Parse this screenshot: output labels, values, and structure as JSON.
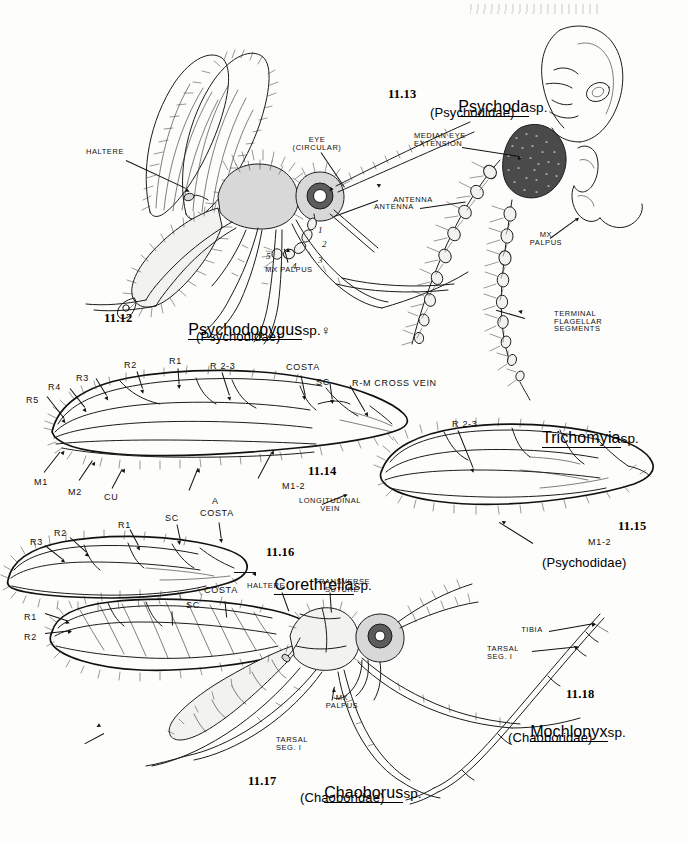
{
  "plate": {
    "title": "Plate 11 — Psychodidae and Chaoboridae",
    "background_color": "#fdfdfb",
    "ink_color": "#1b1b1b"
  },
  "figures": [
    {
      "number": "11.12",
      "genus": "Psychodopygus",
      "sp": "sp.",
      "sex_symbol": "♀",
      "family": "(Psychodidae)",
      "subject": "adult-sand-fly-lateral"
    },
    {
      "number": "11.13",
      "genus": "Psychoda",
      "sp": "sp.",
      "family": "(Psychodidae)",
      "subject": "head-antenna-detail"
    },
    {
      "number": "11.14",
      "genus": "",
      "sp": "",
      "family": "",
      "subject": "psychodid-wing-venation"
    },
    {
      "number": "11.15",
      "genus": "Trichomyia",
      "sp": "sp.",
      "family": "(Psychodidae)",
      "subject": "trichomyia-wing"
    },
    {
      "number": "11.16",
      "genus": "Corethrella",
      "sp": "sp.",
      "family": "",
      "subject": "corethrella-wing"
    },
    {
      "number": "11.17",
      "genus": "Chaoborus",
      "sp": "sp.",
      "family": "(Chaoboridae)",
      "subject": "adult-phantom-midge-lateral"
    },
    {
      "number": "11.18",
      "genus": "Mochlonyx",
      "sp": "sp.",
      "family": "(Chaoboridae)",
      "subject": "hind-leg-detail"
    }
  ],
  "callouts": {
    "haltere": "HALTERE",
    "eye_circular": "EYE\n(CIRCULAR)",
    "mx_palpus": "MX PALPUS",
    "mx_palpus_2line": "MX\nPALPUS",
    "antenna": "ANTENNA",
    "median_eye_extension": "MEDIAN EYE\nEXTENSION",
    "terminal_flagellar_segments": "TERMINAL\nFLAGELLAR\nSEGMENTS",
    "longitudinal_vein": "LONGITUDINAL\nVEIN",
    "transverse_suture": "TRANSVERSE\nSUTURE",
    "tarsal_seg_1": "TARSAL\nSEG. I",
    "tibia": "TIBIA",
    "haltere_2": "HALTERE"
  },
  "palpus_segments": [
    "1",
    "2",
    "3",
    "4",
    "5"
  ],
  "wing_11_14": {
    "veins": [
      "R5",
      "R4",
      "R3",
      "R2",
      "R1",
      "R 2-3",
      "COSTA",
      "SC",
      "R-M CROSS VEIN",
      "M1",
      "M2",
      "CU",
      "A",
      "M1-2"
    ]
  },
  "wing_11_15": {
    "veins": [
      "R 2-3",
      "M1-2"
    ]
  },
  "wing_11_16": {
    "veins": [
      "R3",
      "R2",
      "R1",
      "SC",
      "COSTA"
    ]
  },
  "wing_11_17": {
    "veins": [
      "R2",
      "R1",
      "SC",
      "COSTA"
    ]
  }
}
